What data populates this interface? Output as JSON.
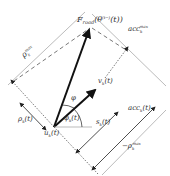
{
  "diagram": {
    "labels": {
      "force": "F",
      "force_sub": "road",
      "force_arg": "(θ",
      "force_arg_sup": "(t−)",
      "force_arg_sub": "k",
      "force_arg_end": "(t))",
      "acc_max": "acc",
      "acc_max_sub": "k",
      "acc_max_sup": "max",
      "rho_max": "ρ",
      "rho_max_sub": "k",
      "rho_max_sup": "max",
      "velocity": "v",
      "velocity_sub": "k",
      "velocity_arg": "(t)",
      "phi": "φ",
      "phi_k": "φ",
      "phi_k_sub": "k",
      "phi_k_arg": "(t)",
      "rho_k": "ρ",
      "rho_k_sub": "k",
      "rho_k_arg": "(t)",
      "s_k": "s",
      "s_k_sub": "k",
      "s_k_arg": "(t)",
      "acc_k": "acc",
      "acc_k_sub": "k",
      "acc_k_arg": "(t)",
      "neg_rho_max": "−ρ",
      "neg_rho_max_sub": "k",
      "neg_rho_max_sup": "max",
      "u_k": "u",
      "u_k_sub": "k",
      "u_k_arg": "(t)"
    },
    "colors": {
      "line": "#222222",
      "boundary": "#999999",
      "dashed": "#555555"
    }
  }
}
